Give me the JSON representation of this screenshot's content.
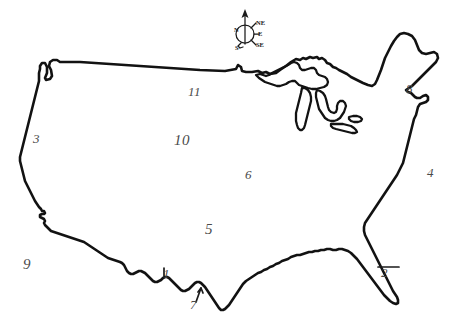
{
  "document": {
    "title": "United States Outline Map",
    "description": "Hand-drawn black outline map of the contiguous United States with Great Lakes, compass rose and handwritten numeric region labels",
    "background_color": "#ffffff",
    "ink_color": "#121212",
    "label_color": "#4a4a4a",
    "width": 456,
    "height": 327
  },
  "compass": {
    "name": "compass-rose",
    "directions": {
      "north": "N",
      "northeast": "NE",
      "east": "E",
      "southeast": "SE",
      "south": "S"
    }
  },
  "labels": [
    {
      "id": "label-11",
      "text": "11",
      "x": 188,
      "y": 85,
      "style": "plain"
    },
    {
      "id": "label-10",
      "text": "10",
      "x": 174,
      "y": 133,
      "style": "big"
    },
    {
      "id": "label-6",
      "text": "6",
      "x": 245,
      "y": 168,
      "style": "plain"
    },
    {
      "id": "label-5",
      "text": "5",
      "x": 205,
      "y": 222,
      "style": "big"
    },
    {
      "id": "label-3",
      "text": "3",
      "x": 33,
      "y": 132,
      "style": "plain"
    },
    {
      "id": "label-9",
      "text": "9",
      "x": 23,
      "y": 257,
      "style": "big"
    },
    {
      "id": "label-8",
      "text": "8",
      "x": 406,
      "y": 82,
      "style": "plain"
    },
    {
      "id": "label-4",
      "text": "4",
      "x": 427,
      "y": 166,
      "style": "plain"
    },
    {
      "id": "label-2",
      "text": "2",
      "x": 381,
      "y": 266,
      "style": "plain"
    },
    {
      "id": "label-7",
      "text": "7",
      "x": 190,
      "y": 298,
      "style": "plain"
    },
    {
      "id": "label-1",
      "text": "1",
      "x": 163,
      "y": 267,
      "style": "plain"
    }
  ]
}
